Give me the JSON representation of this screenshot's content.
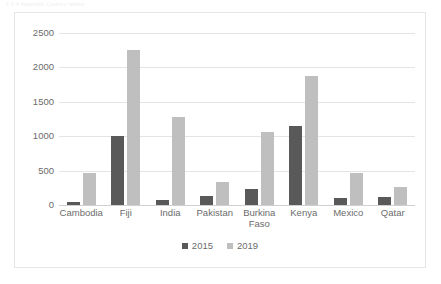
{
  "page": {
    "header_strip_text": "1 0 4     Appendix  Country tables"
  },
  "chart_data": {
    "type": "bar",
    "title": "",
    "subtitle": "",
    "xlabel": "",
    "ylabel": "",
    "categories": [
      "Cambodia",
      "Fiji",
      "India",
      "Pakistan",
      "Burkina\nFaso",
      "Kenya",
      "Mexico",
      "Qatar"
    ],
    "series": [
      {
        "name": "2015",
        "color": "#595959",
        "values": [
          40,
          1000,
          75,
          125,
          240,
          1145,
          100,
          120
        ]
      },
      {
        "name": "2019",
        "color": "#bfbfbf",
        "values": [
          460,
          2255,
          1280,
          340,
          1060,
          1880,
          460,
          260
        ]
      }
    ],
    "ylim": [
      0,
      2500
    ],
    "yticks": [
      0,
      500,
      1000,
      1500,
      2000,
      2500
    ],
    "ytick_labels": [
      "0",
      "500",
      "1000",
      "1500",
      "2000",
      "2500"
    ],
    "grid": true,
    "legend_position": "bottom"
  }
}
